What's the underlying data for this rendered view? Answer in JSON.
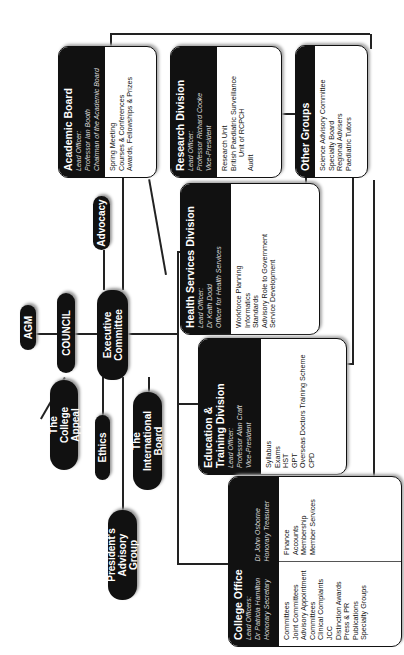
{
  "core": {
    "agm": "AGM",
    "council": "COUNCIL",
    "executive": "Executive Committee"
  },
  "committees": {
    "advocacy": "Advocacy",
    "college_appeal": "The College Appeal",
    "ethics": "Ethics",
    "presidents_group": "President's Advisory Group",
    "international_board": "The International Board"
  },
  "academic_board": {
    "title": "Academic Board",
    "officer_label": "Lead Officer:",
    "officer_name": "Professor Ian Booth",
    "officer_role": "Chairman of the Academic Board",
    "items": [
      "Spring Meeting",
      "Courses & Conferences",
      "Awards, Fellowships & Prizes"
    ]
  },
  "research": {
    "title": "Research Division",
    "officer_label": "Lead Officer:",
    "officer_name": "Professor Richard Cooke",
    "officer_role": "Vice-President",
    "items": [
      "Research Unit",
      "British Paediatric Surveillance",
      "Unit of RCPCH",
      "Audit"
    ]
  },
  "other_groups": {
    "title": "Other Groups",
    "items": [
      "Science Advisory Committee",
      "Specialty Board",
      "Regional Advisers",
      "Paediatric Tutors"
    ]
  },
  "health_services": {
    "title": "Health Services Division",
    "officer_label": "Lead Officer:",
    "officer_name": "Dr Keith Dodd",
    "officer_role": "Officer for Health Services",
    "items": [
      "Workforce Planning",
      "Informatics",
      "Standards",
      "Advisory Role to Government",
      "Service Development"
    ]
  },
  "education": {
    "title": "Education & Training Division",
    "officer_label": "Lead Officer:",
    "officer_name": "Professor Alan Craft",
    "officer_role": "Vice-President",
    "items": [
      "Syllabus",
      "Exams",
      "HST",
      "GPT",
      "Overseas Doctors Training Scheme",
      "CPD"
    ]
  },
  "college_office": {
    "title": "College Office",
    "officer_label": "Lead Officers:",
    "officer1_name": "Dr Patricia Hamilton",
    "officer1_role": "Honorary Secretary",
    "officer2_name": "Dr John Osborne",
    "officer2_role": "Honorary Treasurer",
    "items_left": [
      "Committees",
      "Joint Committees",
      "Advisory Appointment",
      "Committees",
      "Clinical Complaints",
      "JCC",
      "Distinction Awards",
      "Press & PR",
      "Publications",
      "Specialty Groups"
    ],
    "items_right": [
      "Finance",
      "Accounts",
      "Membership",
      "Member Services"
    ]
  }
}
